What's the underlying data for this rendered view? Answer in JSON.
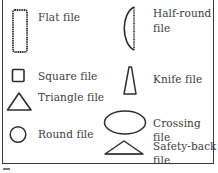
{
  "figure": {
    "title": "",
    "items": [
      {
        "id": "flat",
        "shape": "tall-rectangle-serrated",
        "label_lines": [
          "Flat file"
        ]
      },
      {
        "id": "square",
        "shape": "square",
        "label_lines": [
          "Square file"
        ]
      },
      {
        "id": "triangle",
        "shape": "triangle",
        "label_lines": [
          "Triangle file"
        ]
      },
      {
        "id": "round",
        "shape": "circle",
        "label_lines": [
          "Round file"
        ]
      },
      {
        "id": "half-round",
        "shape": "half-round-serrated",
        "label_lines": [
          "Half-round",
          "file"
        ]
      },
      {
        "id": "knife",
        "shape": "knife-wedge",
        "label_lines": [
          "Knife file"
        ]
      },
      {
        "id": "crossing",
        "shape": "ellipse",
        "label_lines": [
          "Crossing",
          "file"
        ]
      },
      {
        "id": "safety-back",
        "shape": "flat-triangle-serrated",
        "label_lines": [
          "Safety-back",
          "file"
        ]
      }
    ],
    "colors": {
      "stroke": "#2e2e2e",
      "text": "#3c3c3c",
      "frame": "#3a3a3a",
      "background": "#ffffff"
    }
  }
}
